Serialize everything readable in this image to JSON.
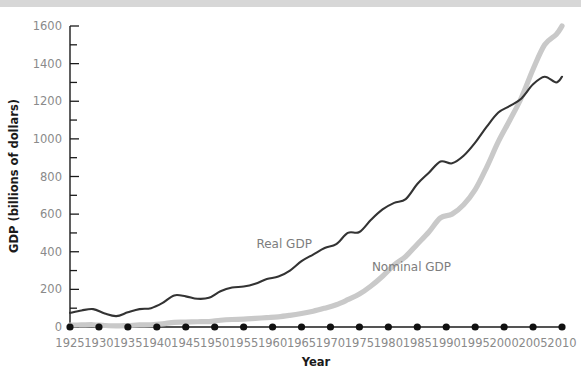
{
  "chart_data": {
    "type": "line",
    "title": "",
    "xlabel": "Year",
    "ylabel": "GDP (billions of dollars)",
    "xlim": [
      1925,
      2010
    ],
    "ylim": [
      0,
      1600
    ],
    "grid": false,
    "legend_position": "inline-annotations",
    "y_ticks": [
      0,
      200,
      400,
      600,
      800,
      1000,
      1200,
      1400,
      1600
    ],
    "y_tick_labels": [
      "0",
      "200",
      "400",
      "600",
      "800",
      "1000",
      "1200",
      "1400",
      "1600"
    ],
    "y_minor_tick_interval": 100,
    "x_ticks": [
      1925,
      1930,
      1935,
      1940,
      1945,
      1950,
      1955,
      1960,
      1965,
      1970,
      1975,
      1980,
      1985,
      1990,
      1995,
      2000,
      2005,
      2010
    ],
    "x_tick_labels": [
      "1925",
      "1930",
      "1935",
      "1940",
      "1945",
      "1950",
      "1955",
      "1960",
      "1965",
      "1970",
      "1975",
      "1980",
      "1985",
      "1990",
      "1995",
      "2000",
      "2005",
      "2010"
    ],
    "x": [
      1925,
      1927,
      1929,
      1931,
      1933,
      1935,
      1937,
      1939,
      1941,
      1943,
      1945,
      1947,
      1949,
      1951,
      1953,
      1955,
      1957,
      1959,
      1961,
      1963,
      1965,
      1967,
      1969,
      1971,
      1973,
      1975,
      1977,
      1979,
      1981,
      1983,
      1985,
      1987,
      1989,
      1991,
      1993,
      1995,
      1997,
      1999,
      2001,
      2003,
      2005,
      2007,
      2009,
      2010
    ],
    "series": [
      {
        "name": "Real GDP",
        "color": "#333333",
        "line_width": 2.1,
        "label_x": 1962,
        "label_y": 420,
        "values": [
          75,
          88,
          95,
          72,
          58,
          78,
          95,
          100,
          128,
          168,
          163,
          150,
          155,
          190,
          210,
          215,
          230,
          255,
          268,
          300,
          350,
          385,
          420,
          440,
          500,
          505,
          570,
          625,
          660,
          680,
          760,
          820,
          880,
          870,
          910,
          980,
          1065,
          1140,
          1175,
          1215,
          1290,
          1330,
          1300,
          1330
        ]
      },
      {
        "name": "Nominal GDP",
        "color": "#c9c9c9",
        "line_width": 5.2,
        "label_x": 1984,
        "label_y": 300,
        "values": [
          10,
          11,
          12,
          8,
          6,
          8,
          11,
          12,
          17,
          25,
          26,
          28,
          29,
          36,
          40,
          42,
          46,
          50,
          54,
          62,
          72,
          84,
          100,
          118,
          145,
          175,
          218,
          270,
          330,
          375,
          440,
          505,
          580,
          600,
          650,
          730,
          850,
          985,
          1100,
          1220,
          1370,
          1500,
          1555,
          1600
        ]
      }
    ]
  },
  "axes": {
    "y_axis_title": "GDP (billions of dollars)",
    "x_axis_title": "Year"
  },
  "annotations": {
    "real_gdp_label": "Real GDP",
    "nominal_gdp_label": "Nominal GDP"
  }
}
